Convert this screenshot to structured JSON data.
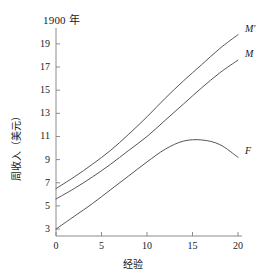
{
  "chart_data": {
    "type": "line",
    "title": "1900 年",
    "xlabel": "经验",
    "ylabel": "周收入（美元）",
    "xlim": [
      0,
      20
    ],
    "ylim": [
      2.4,
      20.2
    ],
    "xticks": [
      0,
      5,
      10,
      15,
      20
    ],
    "xtick_labels": [
      "0",
      "5",
      "10",
      "15",
      "20"
    ],
    "yticks": [
      3,
      5,
      7,
      9,
      11,
      13,
      15,
      17,
      19
    ],
    "ytick_labels": [
      "3",
      "5",
      "7",
      "9",
      "11",
      "13",
      "15",
      "17",
      "19"
    ],
    "grid": false,
    "legend_position": "inline-right-of-curve-ends",
    "line_color": "#555555",
    "axis_color": "#808080",
    "series": [
      {
        "name": "M'",
        "label": "M′",
        "x": [
          0,
          2,
          4,
          6,
          8,
          10,
          12,
          14,
          16,
          18,
          20
        ],
        "values": [
          6.5,
          7.5,
          8.6,
          9.8,
          11.2,
          12.7,
          14.3,
          15.8,
          17.2,
          18.6,
          19.8
        ]
      },
      {
        "name": "M",
        "label": "M",
        "x": [
          0,
          2,
          4,
          6,
          8,
          10,
          12,
          14,
          16,
          18,
          20
        ],
        "values": [
          5.6,
          6.5,
          7.5,
          8.6,
          9.8,
          11.0,
          12.4,
          13.8,
          15.2,
          16.5,
          17.6
        ]
      },
      {
        "name": "F",
        "label": "F",
        "x": [
          0,
          2,
          4,
          6,
          8,
          10,
          12,
          14,
          16,
          18,
          20
        ],
        "values": [
          3.0,
          4.1,
          5.2,
          6.4,
          7.6,
          8.8,
          9.9,
          10.6,
          10.7,
          10.3,
          9.2
        ]
      }
    ]
  },
  "labels": {
    "m_prime": "M′",
    "m": "M",
    "f": "F"
  }
}
